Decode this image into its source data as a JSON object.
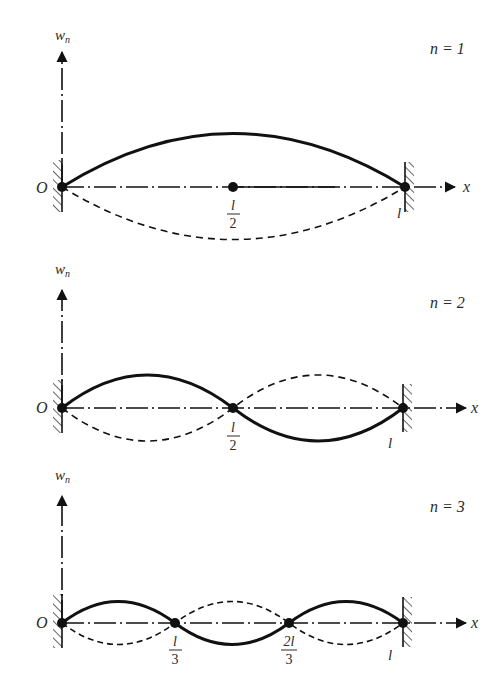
{
  "diagram": {
    "colors": {
      "ink": "#111111",
      "text": "#2a2a2a",
      "background": "#ffffff"
    },
    "panels": [
      {
        "mode_label": "n = 1",
        "y_axis_label": "w",
        "y_axis_subscript": "n",
        "x_axis_label": "x",
        "origin_label": "O",
        "end_label": "l",
        "nodes": [
          {
            "numerator": "l",
            "denominator": "2"
          }
        ],
        "half_waves": 1
      },
      {
        "mode_label": "n = 2",
        "y_axis_label": "w",
        "y_axis_subscript": "n",
        "x_axis_label": "x",
        "origin_label": "O",
        "end_label": "l",
        "nodes": [
          {
            "numerator": "l",
            "denominator": "2"
          }
        ],
        "half_waves": 2
      },
      {
        "mode_label": "n = 3",
        "y_axis_label": "w",
        "y_axis_subscript": "n",
        "x_axis_label": "x",
        "origin_label": "O",
        "end_label": "l",
        "nodes": [
          {
            "numerator": "l",
            "denominator": "3"
          },
          {
            "numerator": "2l",
            "denominator": "3"
          }
        ],
        "half_waves": 3
      }
    ]
  }
}
